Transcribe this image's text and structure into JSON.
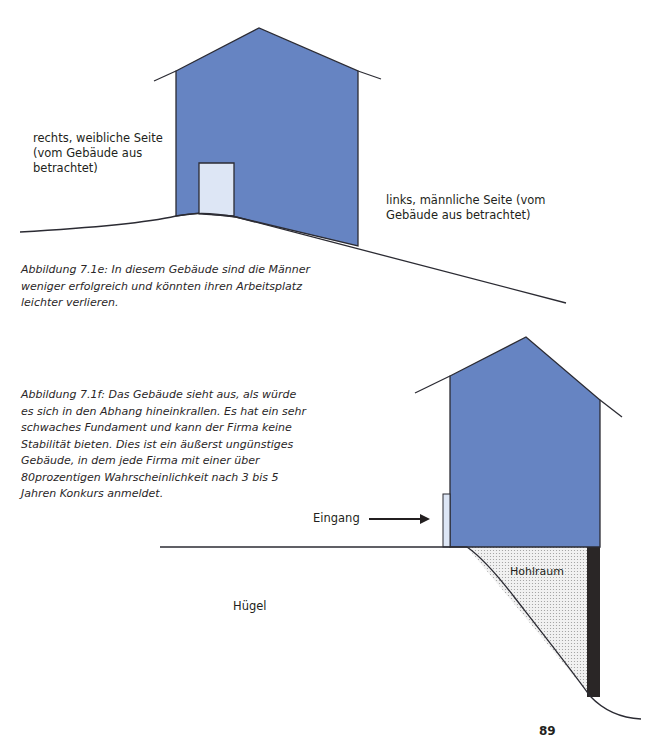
{
  "colors": {
    "building_fill": "#6684c2",
    "door_fill": "#dde6f5",
    "outline": "#2b2b33",
    "void_fill": "#e6e6e6",
    "foundation_dark": "#2a2626"
  },
  "figure_e": {
    "label_right_side": "rechts, weibliche Seite (vom Gebäude aus betrachtet)",
    "label_left_side": "links, männliche Seite (vom Gebäude aus betrachtet)",
    "caption": "Abbildung 7.1e: In diesem Gebäude sind die Männer weniger erfolgreich und könnten ihren Arbeitsplatz leichter verlieren."
  },
  "figure_f": {
    "caption": "Abbildung 7.1f: Das Gebäude sieht aus, als würde es sich in den Abhang hineinkrallen. Es hat ein sehr schwaches Fundament und kann der Firma keine Stabilität bieten. Dies ist ein äußerst ungünstiges Gebäude, in dem jede Firma mit einer über 80prozentigen Wahrscheinlichkeit nach 3 bis 5 Jahren Konkurs anmeldet.",
    "label_entrance": "Eingang",
    "label_void": "Hohlraum",
    "label_hill": "Hügel"
  },
  "page_number": "89"
}
